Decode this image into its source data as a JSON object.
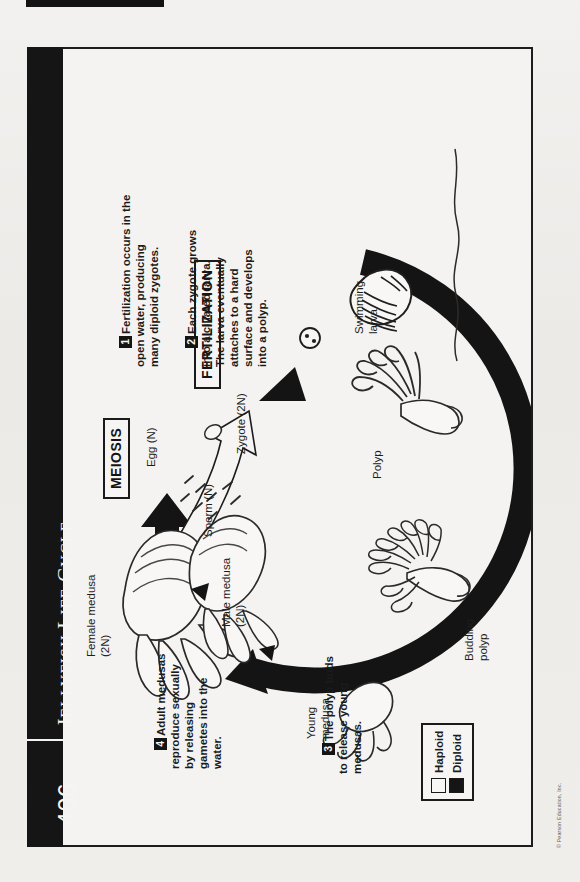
{
  "page": {
    "number": "406",
    "title_main": "ELLYFISH",
    "title_first": "J",
    "title_l": "L",
    "title_life": "IFE",
    "title_c": "C",
    "title_cycle": "YCLE",
    "title_full": "JELLYFISH LIFE CYCLE",
    "copyright": "© Pearson Education, Inc."
  },
  "phases": {
    "meiosis": "MEIOSIS",
    "fertilization": "FERTILIZATION"
  },
  "steps": [
    {
      "num": "1",
      "text": "Fertilization occurs in the\nopen water, producing\nmany diploid zygotes."
    },
    {
      "num": "2",
      "text": "Each zygote grows\ninto a ciliated larva.\nThe larva eventually\nattaches to a hard\nsurface and develops\ninto a polyp."
    },
    {
      "num": "3",
      "text": "The polyp buds\nto release young\nmedusas."
    },
    {
      "num": "4",
      "text": "Adult medusas\nreproduce sexually\nby releasing\ngametes into the\nwater."
    }
  ],
  "labels": {
    "female_medusa": "Female medusa\n(2N)",
    "male_medusa": "Male medusa\n(2N)",
    "egg": "Egg (N)",
    "sperm": "Sperm (N)",
    "zygote": "Zygote (2N)",
    "swimming_larva": "Swimming\nlarva",
    "polyp": "Polyp",
    "budding_polyp": "Budding\npolyp",
    "young_medusa": "Young\nmedusa"
  },
  "legend": {
    "haploid": "Haploid",
    "diploid": "Diploid"
  },
  "colors": {
    "ink": "#151515",
    "paper": "#f2f1ef",
    "frame": "#1c1c1c"
  }
}
